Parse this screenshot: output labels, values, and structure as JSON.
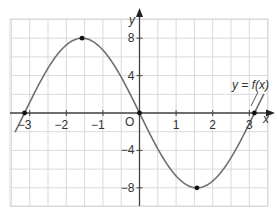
{
  "chart_data": {
    "type": "line",
    "title": "",
    "xlabel": "x",
    "ylabel": "y",
    "curve_label": "y = f(x)",
    "origin_label": "O",
    "xlim": [
      -3.5,
      3.5
    ],
    "ylim": [
      -10,
      10
    ],
    "grid": true,
    "x_ticks": [
      -3,
      -2,
      -1,
      1,
      2,
      3
    ],
    "x_tick_labels": [
      "−3",
      "−2",
      "−1",
      "1",
      "2",
      "3"
    ],
    "y_ticks": [
      8,
      4,
      -4,
      -8
    ],
    "y_tick_labels": [
      "8",
      "4",
      "−4",
      "−8"
    ],
    "series": [
      {
        "name": "y = f(x)",
        "description": "f(x) = -8 sin(x), approximately",
        "x": [
          -3.4,
          -3.14,
          -2.5,
          -2,
          -1.57,
          -1,
          -0.5,
          0,
          0.5,
          1,
          1.57,
          2,
          2.5,
          3.14,
          3.4
        ],
        "values": [
          -2.0,
          0,
          4.8,
          7.3,
          8,
          6.7,
          3.8,
          0,
          -3.8,
          -6.7,
          -8,
          -7.3,
          -4.8,
          0,
          2.0
        ]
      }
    ],
    "marked_points": [
      {
        "x": -3.14,
        "y": 0
      },
      {
        "x": -1.57,
        "y": 8
      },
      {
        "x": 0,
        "y": 0
      },
      {
        "x": 1.57,
        "y": -8
      },
      {
        "x": 3.14,
        "y": 0
      }
    ]
  }
}
